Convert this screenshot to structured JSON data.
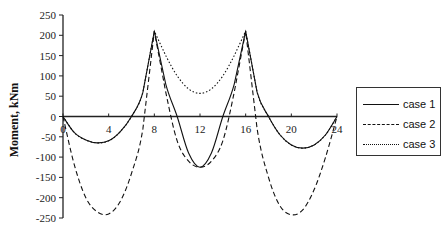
{
  "chart_data": {
    "type": "line",
    "title": "",
    "xlabel": "",
    "ylabel": "Moment, kNm",
    "xlim": [
      0,
      24
    ],
    "ylim": [
      -250,
      250
    ],
    "x_ticks": [
      0,
      4,
      8,
      12,
      16,
      20,
      24
    ],
    "y_ticks": [
      250,
      200,
      150,
      100,
      50,
      0,
      -50,
      -100,
      -150,
      -200,
      -250
    ],
    "grid": false,
    "legend_position": "right",
    "x": [
      0,
      1,
      2,
      3,
      4,
      5,
      6,
      7,
      8,
      9,
      10,
      11,
      12,
      13,
      14,
      15,
      16,
      17,
      18,
      19,
      20,
      21,
      22,
      23,
      24
    ],
    "series": [
      {
        "name": "case 1",
        "style": "solid",
        "values": [
          0,
          -40,
          -58,
          -65,
          -60,
          -38,
          0,
          60,
          210,
          80,
          0,
          -90,
          -125,
          -90,
          0,
          80,
          210,
          60,
          0,
          -45,
          -70,
          -78,
          -70,
          -45,
          0
        ]
      },
      {
        "name": "case 2",
        "style": "dashed",
        "values": [
          0,
          -120,
          -200,
          -235,
          -240,
          -210,
          -140,
          -30,
          210,
          60,
          -60,
          -110,
          -125,
          -110,
          -60,
          60,
          210,
          -30,
          -150,
          -220,
          -242,
          -230,
          -180,
          -100,
          0
        ]
      },
      {
        "name": "case 3",
        "style": "dotted",
        "values": [
          0,
          -40,
          -58,
          -65,
          -60,
          -38,
          0,
          60,
          210,
          150,
          100,
          68,
          57,
          68,
          100,
          150,
          210,
          60,
          0,
          -45,
          -70,
          -78,
          -70,
          -45,
          0
        ]
      }
    ]
  },
  "legend": {
    "items": [
      {
        "label": "case 1",
        "style": "solid"
      },
      {
        "label": "case 2",
        "style": "dashed"
      },
      {
        "label": "case 3",
        "style": "dotted"
      }
    ]
  }
}
